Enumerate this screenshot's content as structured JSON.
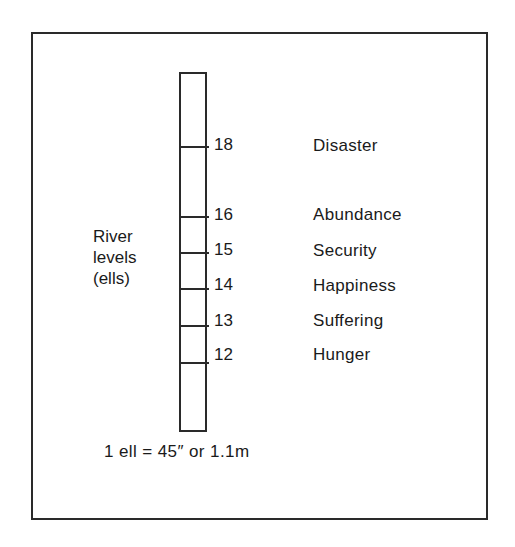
{
  "diagram": {
    "axis_title": [
      "River",
      "levels",
      "(ells)"
    ],
    "levels": [
      {
        "value": "18",
        "meaning": "Disaster"
      },
      {
        "value": "16",
        "meaning": "Abundance"
      },
      {
        "value": "15",
        "meaning": "Security"
      },
      {
        "value": "14",
        "meaning": "Happiness"
      },
      {
        "value": "13",
        "meaning": "Suffering"
      },
      {
        "value": "12",
        "meaning": "Hunger"
      }
    ],
    "footnote": "1 ell = 45″ or 1.1m",
    "colors": {
      "line": "#2a2a2a",
      "text": "#1a1a1a",
      "background": "#ffffff"
    }
  }
}
